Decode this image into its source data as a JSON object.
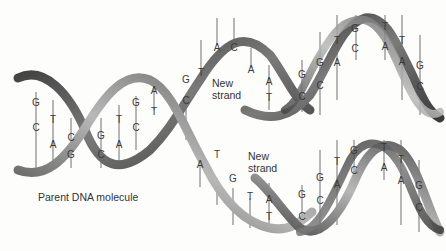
{
  "diagram": {
    "labels": {
      "parent": "Parent DNA molecule",
      "new_strand_top": "New\nstrand",
      "new_strand_top_l1": "New",
      "new_strand_top_l2": "strand",
      "new_strand_bottom_l1": "New",
      "new_strand_bottom_l2": "strand"
    },
    "colors": {
      "ribbon_dark": "#3c3c3c",
      "ribbon_mid": "#8a8a8a",
      "ribbon_light": "#c9c9c9",
      "rung": "#6b6b6b",
      "text": "#333333"
    },
    "parent_pairs": [
      {
        "top": "G",
        "bottom": "C"
      },
      {
        "top": "T",
        "bottom": "A"
      },
      {
        "top": "C",
        "bottom": "G"
      },
      {
        "top": "G",
        "bottom": "C"
      },
      {
        "top": "T",
        "bottom": "A"
      },
      {
        "top": "G",
        "bottom": "C"
      },
      {
        "top": "A",
        "bottom": "T"
      },
      {
        "top": "G",
        "bottom": "C"
      }
    ],
    "unpaired_top_strand": [
      "T",
      "A",
      "C",
      "A"
    ],
    "unpaired_bottom_strand": [
      "A",
      "T",
      "G",
      "T"
    ],
    "upper_daughter_pairs": [
      {
        "top": "A",
        "bottom": "T"
      },
      {
        "top": "G",
        "bottom": "C"
      },
      {
        "top": "G",
        "bottom": "C"
      },
      {
        "top": "T",
        "bottom": "A"
      },
      {
        "top": "G",
        "bottom": "C"
      },
      {
        "top": "T",
        "bottom": "A"
      },
      {
        "top": "T",
        "bottom": "A"
      },
      {
        "top": "G",
        "bottom": "C"
      }
    ],
    "lower_daughter_pairs": [
      {
        "top": "A",
        "bottom": "T"
      },
      {
        "top": "G",
        "bottom": "C"
      },
      {
        "top": "G",
        "bottom": "C"
      },
      {
        "top": "T",
        "bottom": "A"
      },
      {
        "top": "G",
        "bottom": "C"
      },
      {
        "top": "T",
        "bottom": "A"
      },
      {
        "top": "T",
        "bottom": "A"
      },
      {
        "top": "G",
        "bottom": "C"
      }
    ]
  }
}
